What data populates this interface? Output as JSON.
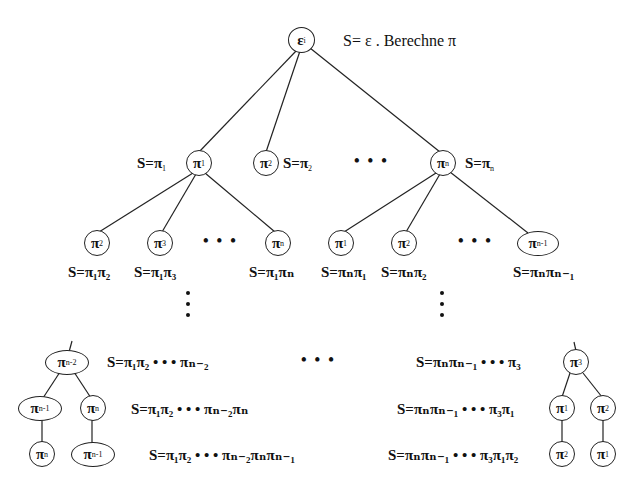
{
  "root": {
    "node": {
      "sym": "ε",
      "sub": "i"
    },
    "label": "S= ε . Berechne  π"
  },
  "level1": {
    "nodes": [
      {
        "sym": "π",
        "sub": "1",
        "label_pre": "S=π",
        "label_sub": "1"
      },
      {
        "sym": "π",
        "sub": "2",
        "label_pre": "S=π",
        "label_sub": "2"
      },
      {
        "sym": "π",
        "sub": "n",
        "label_pre": "S=π",
        "label_sub": "n"
      }
    ],
    "ellipsis": "• • •"
  },
  "level2": {
    "left_group": [
      {
        "sym": "π",
        "sub": "2",
        "label": "S=π₁π₂"
      },
      {
        "sym": "π",
        "sub": "3",
        "label": "S=π₁π₃"
      },
      {
        "sym": "π",
        "sub": "n",
        "label": "S=π₁πₙ"
      }
    ],
    "right_group": [
      {
        "sym": "π",
        "sub": "1",
        "label": "S=πₙπ₁"
      },
      {
        "sym": "π",
        "sub": "2",
        "label": "S=πₙπ₂"
      },
      {
        "sym": "π",
        "sub": "n-1",
        "label": "S=πₙπₙ₋₁"
      }
    ],
    "ellipsis": "• • •"
  },
  "bottom_left": {
    "nodes": [
      {
        "sym": "π",
        "sub": "n-2"
      },
      {
        "sym": "π",
        "sub": "n-1"
      },
      {
        "sym": "π",
        "sub": "n"
      },
      {
        "sym": "π",
        "sub": "n"
      },
      {
        "sym": "π",
        "sub": "n-1"
      }
    ],
    "labels": [
      "S=π₁π₂ • • • πₙ₋₂",
      "S=π₁π₂ • • • πₙ₋₂πₙ",
      "S=π₁π₂ • • • πₙ₋₂πₙπₙ₋₁"
    ]
  },
  "bottom_middle_ellipsis": "• • •",
  "bottom_right": {
    "nodes": [
      {
        "sym": "π",
        "sub": "3"
      },
      {
        "sym": "π",
        "sub": "1"
      },
      {
        "sym": "π",
        "sub": "2"
      },
      {
        "sym": "π",
        "sub": "2"
      },
      {
        "sym": "π",
        "sub": "1"
      }
    ],
    "labels": [
      "S=πₙπₙ₋₁ • • • π₃",
      "S=πₙπₙ₋₁ • • • π₃π₁",
      "S=πₙπₙ₋₁ • • • π₃π₁π₂"
    ]
  },
  "colors": {
    "line": "#222222",
    "text": "#111111",
    "background": "#ffffff"
  }
}
